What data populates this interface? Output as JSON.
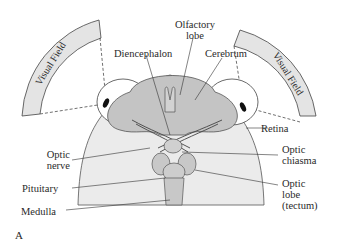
{
  "diagram": {
    "panel_label": "A",
    "visual_field_left": "Visual Field",
    "visual_field_right": "Visual Field",
    "labels": {
      "olfactory_lobe_1": "Olfactory",
      "olfactory_lobe_2": "lobe",
      "diencephalon": "Diencephalon",
      "cerebrum": "Cerebrum",
      "retina": "Retina",
      "optic_nerve_1": "Optic",
      "optic_nerve_2": "nerve",
      "optic_chiasma_1": "Optic",
      "optic_chiasma_2": "chiasma",
      "pituitary": "Pituitary",
      "medulla": "Medulla",
      "optic_lobe_1": "Optic",
      "optic_lobe_2": "lobe",
      "optic_lobe_3": "(tectum)"
    },
    "colors": {
      "head": "#ebebeb",
      "brain": "#c4c4c4",
      "eye": "#ffffff",
      "field_band": "#e4e4e4",
      "line": "#3a3a3a"
    }
  }
}
